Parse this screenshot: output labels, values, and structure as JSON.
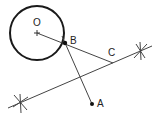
{
  "diagram": {
    "labels": {
      "O": "O",
      "B": "B",
      "C": "C",
      "A": "A"
    },
    "colors": {
      "stroke": "#333333",
      "circle": "#1a1a1a",
      "background": "#ffffff"
    }
  }
}
